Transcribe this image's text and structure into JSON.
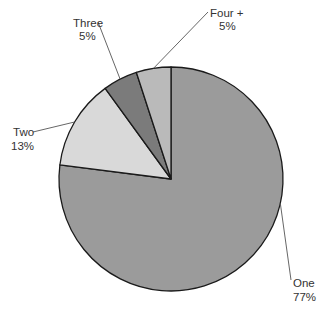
{
  "chart_data": {
    "type": "pie",
    "title": "",
    "start": "top",
    "direction": "clockwise",
    "slices": [
      {
        "label": "One",
        "pct_label": "77%",
        "value": 77,
        "color": "#9b9b9b"
      },
      {
        "label": "Two",
        "pct_label": "13%",
        "value": 13,
        "color": "#d9d9d9"
      },
      {
        "label": "Three",
        "pct_label": "5%",
        "value": 5,
        "color": "#7b7b7b"
      },
      {
        "label": "Four +",
        "pct_label": "5%",
        "value": 5,
        "color": "#bababa"
      }
    ],
    "edge_color": "#1a1a1a",
    "leader_color": "#555555"
  }
}
